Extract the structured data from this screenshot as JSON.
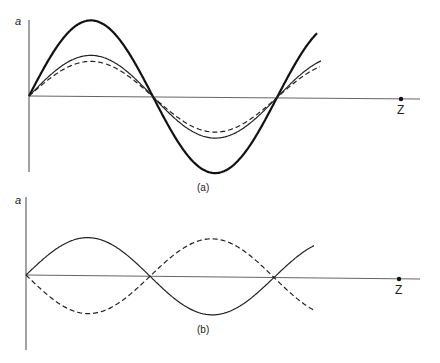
{
  "panels": [
    {
      "id": "a",
      "caption": "(a)",
      "y_axis_label": "a",
      "x_axis_label": "Z",
      "curves": [
        {
          "name": "thick-solid",
          "style": "solid",
          "amplitude": 76
        },
        {
          "name": "thin-solid",
          "style": "solid",
          "amplitude": 41
        },
        {
          "name": "dashed",
          "style": "dashed",
          "amplitude": 35
        }
      ]
    },
    {
      "id": "b",
      "caption": "(b)",
      "y_axis_label": "a",
      "x_axis_label": "Z",
      "curves": [
        {
          "name": "solid",
          "style": "solid",
          "amplitude": 38,
          "phase": "0"
        },
        {
          "name": "dashed",
          "style": "dashed",
          "amplitude": 38,
          "phase": "pi"
        }
      ]
    }
  ]
}
